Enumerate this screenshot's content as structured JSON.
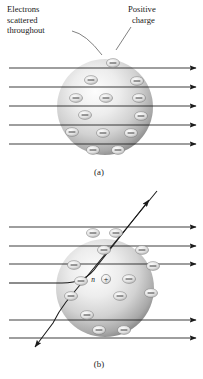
{
  "figure": {
    "background_color": "#ffffff",
    "ink_color": "#1a1a1a",
    "width": 203,
    "height": 379
  },
  "panel_a": {
    "caption": "(a)",
    "caption_pos": {
      "x": 99,
      "y": 174
    },
    "labels": [
      {
        "name": "electrons-label",
        "lines": [
          "Electrons",
          "scattered",
          "throughout"
        ],
        "x": 7,
        "y": 12,
        "line_height": 10.6,
        "leader": {
          "x1": 72,
          "y1": 32.5,
          "x2": 102,
          "y2": 55
        }
      },
      {
        "name": "positive-charge-label",
        "lines": [
          "Positive",
          "charge"
        ],
        "x": 128,
        "y": 12,
        "line_height": 10.6,
        "leader": {
          "x1": 133,
          "y1": 27,
          "x2": 117,
          "y2": 49
        }
      }
    ],
    "sphere": {
      "cx": 105,
      "cy": 107,
      "r": 48,
      "highlight_cx": 82,
      "highlight_cy": 80,
      "color_light": "#fdfdfd",
      "color_mid": "#cfcfcf",
      "color_dark": "#8d8d8d",
      "color_edge": "#4f4f4f"
    },
    "electrons": [
      {
        "cx": 113,
        "cy": 63
      },
      {
        "cx": 91,
        "cy": 80
      },
      {
        "cx": 137,
        "cy": 81
      },
      {
        "cx": 76,
        "cy": 98
      },
      {
        "cx": 106,
        "cy": 98
      },
      {
        "cx": 139,
        "cy": 98
      },
      {
        "cx": 85,
        "cy": 115
      },
      {
        "cx": 141,
        "cy": 116
      },
      {
        "cx": 72,
        "cy": 132
      },
      {
        "cx": 103,
        "cy": 133
      },
      {
        "cx": 131,
        "cy": 133
      },
      {
        "cx": 93,
        "cy": 150
      },
      {
        "cx": 118,
        "cy": 150
      }
    ],
    "rays": [
      {
        "y": 68,
        "x_start": 9,
        "x_end": 196
      },
      {
        "y": 87,
        "x_start": 9,
        "x_end": 196
      },
      {
        "y": 106,
        "x_start": 9,
        "x_end": 196
      },
      {
        "y": 125,
        "x_start": 9,
        "x_end": 196
      },
      {
        "y": 144,
        "x_start": 9,
        "x_end": 196
      }
    ],
    "ray_description": "Five parallel horizontal beams pass straight through undeflected, arrowheads at right"
  },
  "panel_b": {
    "caption": "(b)",
    "caption_pos": {
      "x": 99,
      "y": 366
    },
    "sphere": {
      "cx": 105,
      "cy": 288,
      "r": 49,
      "highlight_cx": 82,
      "highlight_cy": 261,
      "color_light": "#fdfdfd",
      "color_mid": "#cfcfcf",
      "color_dark": "#8d8d8d",
      "color_edge": "#4f4f4f"
    },
    "nucleus": {
      "letter": "n",
      "sign": "+",
      "letter_x": 93,
      "letter_y": 282,
      "circle_cx": 106,
      "circle_cy": 279,
      "circle_r": 4.6
    },
    "electrons": [
      {
        "cx": 93,
        "cy": 233
      },
      {
        "cx": 116,
        "cy": 233
      },
      {
        "cx": 104,
        "cy": 250
      },
      {
        "cx": 142,
        "cy": 250
      },
      {
        "cx": 74,
        "cy": 265
      },
      {
        "cx": 153,
        "cy": 266
      },
      {
        "cx": 129,
        "cy": 279
      },
      {
        "cx": 81,
        "cy": 281
      },
      {
        "cx": 71,
        "cy": 296
      },
      {
        "cx": 120,
        "cy": 296
      },
      {
        "cx": 151,
        "cy": 293
      },
      {
        "cx": 87,
        "cy": 315
      },
      {
        "cx": 99,
        "cy": 330
      },
      {
        "cx": 124,
        "cy": 330
      }
    ],
    "rays": [
      {
        "y": 227,
        "x_start": 9,
        "x_end": 196
      },
      {
        "y": 246,
        "x_start": 9,
        "x_end": 196
      },
      {
        "y": 264,
        "x_start": 9,
        "x_end": 196
      },
      {
        "y": 320,
        "x_start": 9,
        "x_end": 196
      },
      {
        "y": 338,
        "x_start": 9,
        "x_end": 196
      }
    ],
    "deflected_ray": {
      "name": "small-angle-deflected-ray",
      "path": "M 9 283 L 64 283 Q 88 283 98 268 L 152 198",
      "arrow_tip": {
        "x": 152,
        "y": 198
      },
      "angle_deg": 52,
      "description": "Beam entering at left curves upward near nucleus and exits toward upper right"
    },
    "backscattered_ray": {
      "name": "large-angle-deflected-ray",
      "path": "M 157 191 L 64 304 Q 58 312 52 324 L 33 350",
      "arrow_tip": {
        "x": 33,
        "y": 350
      },
      "description": "Steeply deflected trajectory crossing the sphere and exiting toward lower left"
    }
  },
  "legend_notes": {
    "electron_symbol": "−",
    "nucleus_symbol": "+",
    "panel_a_model": "Thomson plum-pudding model: positive charge spread uniformly, electrons scattered throughout, beams undeflected",
    "panel_b_model": "Rutherford nuclear model: concentrated positive nucleus causes large-angle deflections"
  }
}
